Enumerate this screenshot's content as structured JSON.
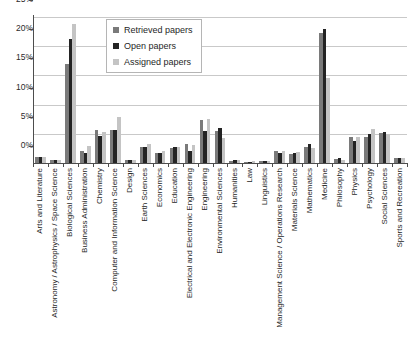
{
  "chart_data": {
    "type": "bar",
    "title": "",
    "xlabel": "",
    "ylabel": "",
    "ylim": [
      0,
      25
    ],
    "ytick_labels": [
      "0%",
      "5%",
      "10%",
      "15%",
      "20%",
      "25%"
    ],
    "ytick_values": [
      0,
      5,
      10,
      15,
      20,
      25
    ],
    "grid": true,
    "legend_position": "top-center-inside",
    "categories": [
      "Arts and Literature",
      "Astronomy / Astrophysics / Space Science",
      "Biological Sciences",
      "Business Administration",
      "Chemistry",
      "Computer and Information Science",
      "Design",
      "Earth Sciences",
      "Economics",
      "Education",
      "Electrical and Electronic Engineering",
      "Engineering",
      "Environmental Sciences",
      "Humanities",
      "Law",
      "Linguistics",
      "Management Science / Operations Research",
      "Materials Science",
      "Mathematics",
      "Medicine",
      "Philosophy",
      "Physics",
      "Psychology",
      "Social Sciences",
      "Sports and Recreation"
    ],
    "series": [
      {
        "name": "Retrieved papers",
        "color": "#7a7a7a",
        "values": [
          1.0,
          0.5,
          16.9,
          2.1,
          5.6,
          5.7,
          0.6,
          2.7,
          1.8,
          2.6,
          3.3,
          7.3,
          5.4,
          0.4,
          0.2,
          0.3,
          2.1,
          1.6,
          2.7,
          22.3,
          0.7,
          4.4,
          4.5,
          5.2,
          0.8
        ]
      },
      {
        "name": "Open papers",
        "color": "#242424",
        "values": [
          1.1,
          0.5,
          21.3,
          1.8,
          4.7,
          5.7,
          0.6,
          2.8,
          1.8,
          2.7,
          2.1,
          5.5,
          6.0,
          0.5,
          0.2,
          0.3,
          1.8,
          1.7,
          3.2,
          23.0,
          0.8,
          3.7,
          5.0,
          5.3,
          0.9
        ]
      },
      {
        "name": "Assigned papers",
        "color": "#c4c4c4",
        "values": [
          1.1,
          0.5,
          23.8,
          2.9,
          5.3,
          7.9,
          0.6,
          3.3,
          2.0,
          2.8,
          3.1,
          7.6,
          4.2,
          0.5,
          0.3,
          0.4,
          2.1,
          1.9,
          2.6,
          14.5,
          0.6,
          4.5,
          5.8,
          4.9,
          0.9
        ]
      }
    ]
  },
  "legend": {
    "items": [
      {
        "label": "Retrieved papers",
        "key": "retrieved"
      },
      {
        "label": "Open papers",
        "key": "open"
      },
      {
        "label": "Assigned papers",
        "key": "assigned"
      }
    ]
  }
}
